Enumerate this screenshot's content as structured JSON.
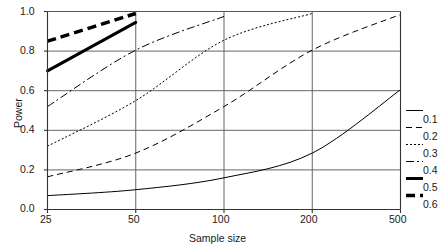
{
  "chart_data": {
    "type": "line",
    "title": "",
    "xlabel": "Sample size",
    "ylabel": "Power",
    "categories": [
      "25",
      "50",
      "100",
      "200",
      "500"
    ],
    "x": [
      25,
      50,
      100,
      200,
      500
    ],
    "ylim": [
      0.0,
      1.0
    ],
    "yticks": [
      "0.0",
      "0.2",
      "0.4",
      "0.6",
      "0.8",
      "1.0"
    ],
    "ytick_values": [
      0.0,
      0.2,
      0.4,
      0.6,
      0.8,
      1.0
    ],
    "grid": "horizontal-and-vertical",
    "legend_position": "right",
    "legend_title": "",
    "series": [
      {
        "name": "0.1",
        "style": "solid-thin",
        "width": 1.0,
        "dash": "none",
        "values": [
          0.07,
          0.1,
          0.16,
          0.285,
          0.605
        ]
      },
      {
        "name": "0.2",
        "style": "dashed",
        "width": 1.0,
        "dash": "6,4",
        "values": [
          0.165,
          0.285,
          0.52,
          0.805,
          0.985
        ]
      },
      {
        "name": "0.3",
        "style": "dotted",
        "width": 1.0,
        "dash": "2,2",
        "values": [
          0.32,
          0.55,
          0.855,
          0.99,
          null
        ]
      },
      {
        "name": "0.4",
        "style": "dash-dot",
        "width": 1.0,
        "dash": "8,3,2,3",
        "values": [
          0.52,
          0.805,
          0.975,
          null,
          null
        ]
      },
      {
        "name": "0.5",
        "style": "solid-thick",
        "width": 3.0,
        "dash": "none",
        "values": [
          0.7,
          0.945,
          null,
          null,
          null
        ]
      },
      {
        "name": "0.6",
        "style": "dashed-thick",
        "width": 3.5,
        "dash": "9,5",
        "values": [
          0.85,
          0.99,
          null,
          null,
          null
        ]
      }
    ],
    "colors": {
      "line": "#000000",
      "grid": "#555555",
      "axis": "#333333",
      "background": "#ffffff"
    }
  },
  "legend": {
    "entries": [
      {
        "label": "0.1",
        "swatch": "solid-thin-swatch"
      },
      {
        "label": "0.2",
        "swatch": "dashed-swatch"
      },
      {
        "label": "0.3",
        "swatch": "dotted-swatch"
      },
      {
        "label": "0.4",
        "swatch": "dash-dot-swatch"
      },
      {
        "label": "0.5",
        "swatch": "solid-thick-swatch"
      },
      {
        "label": "0.6",
        "swatch": "dashed-thick-swatch"
      }
    ]
  },
  "axes": {
    "x_title": "Sample size",
    "y_title": "Power",
    "x_ticks": [
      "25",
      "50",
      "100",
      "200",
      "500"
    ],
    "y_ticks": [
      "0.0",
      "0.2",
      "0.4",
      "0.6",
      "0.8",
      "1.0"
    ]
  }
}
